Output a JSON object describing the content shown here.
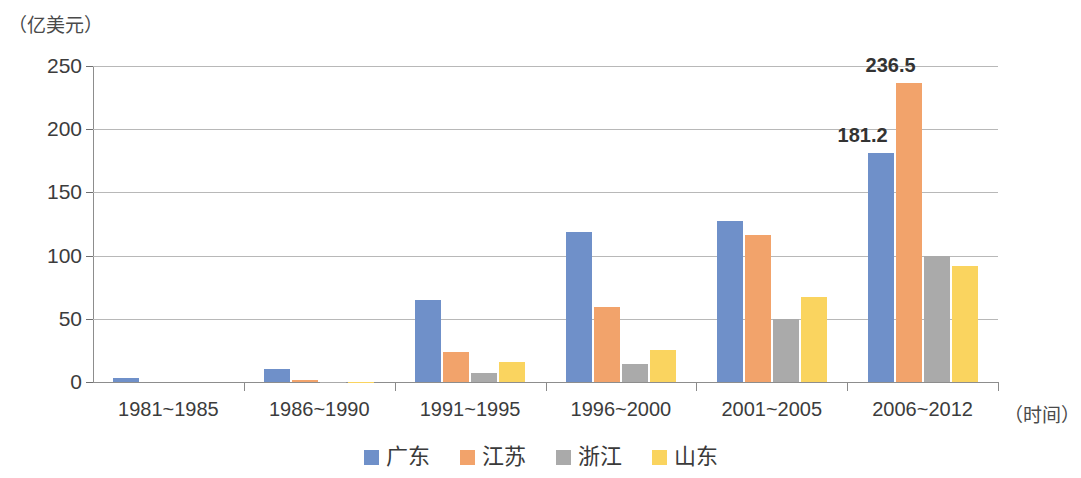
{
  "chart_data": {
    "type": "bar",
    "title": "",
    "subtitle": "",
    "xlabel": "（时间）",
    "ylabel": "（亿美元）",
    "categories": [
      "1981~1985",
      "1986~1990",
      "1991~1995",
      "1996~2000",
      "2001~2005",
      "2006~2012"
    ],
    "series": [
      {
        "name": "广东",
        "color": "#6f90c9",
        "values": [
          3,
          10,
          65,
          119,
          127,
          181.2
        ]
      },
      {
        "name": "江苏",
        "color": "#f2a36b",
        "values": [
          0,
          1.5,
          24,
          59,
          116,
          236.5
        ]
      },
      {
        "name": "浙江",
        "color": "#aaaaaa",
        "values": [
          0,
          0.3,
          7,
          14,
          50,
          100
        ]
      },
      {
        "name": "山东",
        "color": "#fad45f",
        "values": [
          0,
          0.3,
          16,
          25,
          67,
          92
        ]
      }
    ],
    "ylim": [
      0,
      250
    ],
    "yticks": [
      0,
      50,
      100,
      150,
      200,
      250
    ],
    "ytick_labels": [
      "0",
      "50",
      "100",
      "150",
      "200",
      "250"
    ],
    "grid": true,
    "legend_position": "bottom",
    "data_labels": [
      {
        "text": "236.5",
        "series": "江苏",
        "category": "2006~2012",
        "value": 236.5
      },
      {
        "text": "181.2",
        "series": "广东",
        "category": "2006~2012",
        "value": 181.2
      }
    ]
  }
}
